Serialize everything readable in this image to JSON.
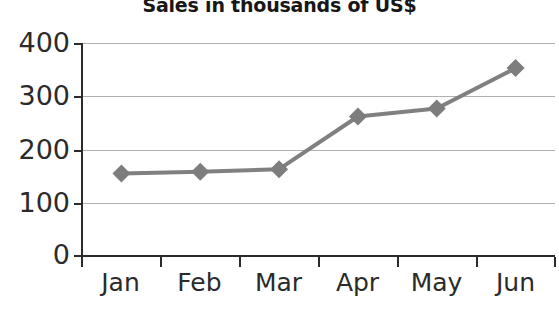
{
  "chart_data": {
    "type": "line",
    "title": "Sales in thousands of US$",
    "subtitle": "",
    "xlabel": "",
    "ylabel": "",
    "categories": [
      "Jan",
      "Feb",
      "Mar",
      "Apr",
      "May",
      "Jun"
    ],
    "values": [
      155,
      158,
      163,
      262,
      277,
      353
    ],
    "series": [
      {
        "name": "Sales",
        "values": [
          155,
          158,
          163,
          262,
          277,
          353
        ]
      }
    ],
    "ylim": [
      0,
      400
    ],
    "yticks": [
      0,
      100,
      200,
      300,
      400
    ],
    "ytick_labels": [
      "0",
      "100",
      "200",
      "300",
      "400"
    ],
    "grid": "horizontal",
    "legend": "none",
    "marker": "diamond",
    "line_color": "#808080",
    "marker_color": "#7d7d7d",
    "grid_color": "#b0b0b0",
    "axis_color": "#2b2b2b",
    "title_color": "#171717",
    "background": "#ffffff"
  }
}
